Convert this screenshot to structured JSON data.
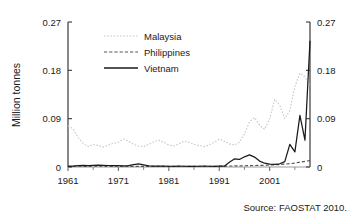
{
  "chart_data": {
    "type": "line",
    "title": "",
    "xlabel": "",
    "ylabel": "Million tonnes",
    "xlim": [
      1961,
      2009
    ],
    "ylim": [
      0,
      0.27
    ],
    "grid": false,
    "legend_position": "top-left-inside",
    "y_ticks": [
      "0",
      "0.09",
      "0.18",
      "0.27"
    ],
    "y_tick_values": [
      0,
      0.09,
      0.18,
      0.27
    ],
    "x_ticks": [
      "1961",
      "1971",
      "1981",
      "1991",
      "2001"
    ],
    "x_tick_values": [
      1961,
      1971,
      1981,
      1991,
      2001
    ],
    "x_minor_tick_values": [
      1966,
      1976,
      1986,
      1996,
      2006
    ],
    "dual_y_axis": true,
    "right_y_ticks": [
      "0",
      "0.09",
      "0.18",
      "0.27"
    ],
    "x": [
      1961,
      1962,
      1963,
      1964,
      1965,
      1966,
      1967,
      1968,
      1969,
      1970,
      1971,
      1972,
      1973,
      1974,
      1975,
      1976,
      1977,
      1978,
      1979,
      1980,
      1981,
      1982,
      1983,
      1984,
      1985,
      1986,
      1987,
      1988,
      1989,
      1990,
      1991,
      1992,
      1993,
      1994,
      1995,
      1996,
      1997,
      1998,
      1999,
      2000,
      2001,
      2002,
      2003,
      2004,
      2005,
      2006,
      2007,
      2008,
      2009
    ],
    "series": [
      {
        "name": "Malaysia",
        "style": "dotted",
        "color": "#c9c9c9",
        "values": [
          0.077,
          0.071,
          0.055,
          0.044,
          0.038,
          0.042,
          0.04,
          0.037,
          0.041,
          0.044,
          0.046,
          0.052,
          0.048,
          0.042,
          0.039,
          0.038,
          0.042,
          0.047,
          0.05,
          0.046,
          0.041,
          0.039,
          0.043,
          0.048,
          0.046,
          0.042,
          0.04,
          0.038,
          0.041,
          0.046,
          0.052,
          0.048,
          0.043,
          0.041,
          0.046,
          0.062,
          0.084,
          0.092,
          0.078,
          0.07,
          0.09,
          0.126,
          0.115,
          0.09,
          0.105,
          0.15,
          0.175,
          0.168,
          0.15
        ]
      },
      {
        "name": "Philippines",
        "style": "dashed",
        "color": "#555555",
        "values": [
          0.0012,
          0.0013,
          0.0014,
          0.0013,
          0.0012,
          0.0014,
          0.0015,
          0.0013,
          0.0012,
          0.0013,
          0.0014,
          0.0012,
          0.0011,
          0.0012,
          0.0013,
          0.0012,
          0.0011,
          0.0012,
          0.0013,
          0.0012,
          0.0011,
          0.0012,
          0.0013,
          0.0014,
          0.0013,
          0.0012,
          0.0013,
          0.0014,
          0.0013,
          0.0014,
          0.0015,
          0.0016,
          0.0018,
          0.002,
          0.0022,
          0.0024,
          0.0026,
          0.0028,
          0.003,
          0.0032,
          0.0036,
          0.004,
          0.0046,
          0.0054,
          0.0062,
          0.0074,
          0.009,
          0.0105,
          0.012
        ]
      },
      {
        "name": "Vietnam",
        "style": "solid",
        "color": "#1a1a1a",
        "values": [
          0.001,
          0.0018,
          0.0024,
          0.003,
          0.0026,
          0.003,
          0.0034,
          0.003,
          0.0028,
          0.0026,
          0.0024,
          0.0022,
          0.0026,
          0.0046,
          0.0058,
          0.004,
          0.002,
          0.0018,
          0.0016,
          0.0015,
          0.0014,
          0.0014,
          0.0015,
          0.0014,
          0.0013,
          0.0013,
          0.0014,
          0.0015,
          0.0014,
          0.0014,
          0.0015,
          0.0016,
          0.009,
          0.015,
          0.014,
          0.019,
          0.0225,
          0.0185,
          0.011,
          0.007,
          0.0055,
          0.005,
          0.006,
          0.01,
          0.042,
          0.028,
          0.096,
          0.05,
          0.235
        ]
      }
    ],
    "source_note": "Source: FAOSTAT 2010."
  }
}
